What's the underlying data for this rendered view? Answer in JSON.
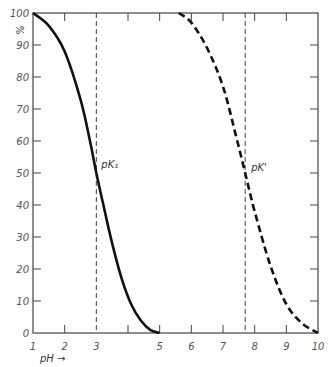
{
  "chart_data": {
    "type": "line",
    "title": "",
    "xlabel": "pH →",
    "ylabel": "%",
    "xlim": [
      1,
      10
    ],
    "ylim": [
      0,
      100
    ],
    "x_ticks": [
      1,
      2,
      3,
      4,
      5,
      6,
      7,
      8,
      9,
      10
    ],
    "x_tick_labels": [
      "1",
      "2",
      "3",
      "",
      "5",
      "6",
      "7",
      "8",
      "9",
      "10"
    ],
    "y_ticks": [
      0,
      10,
      20,
      30,
      40,
      50,
      60,
      70,
      80,
      90,
      100
    ],
    "y_tick_labels": [
      "0",
      "10",
      "20",
      "30",
      "40",
      "50",
      "60",
      "70",
      "80",
      "90",
      "100"
    ],
    "grid": false,
    "legend": null,
    "series": [
      {
        "name": "pK1 curve",
        "style": "solid",
        "x": [
          1.0,
          1.5,
          2.0,
          2.5,
          2.8,
          3.0,
          3.2,
          3.5,
          3.8,
          4.1,
          4.4,
          4.7,
          5.0
        ],
        "values": [
          100,
          96,
          88,
          73,
          60,
          50,
          41,
          28,
          17,
          9,
          4,
          1,
          0
        ]
      },
      {
        "name": "pK' curve",
        "style": "dashed",
        "x": [
          5.6,
          6.0,
          6.5,
          7.0,
          7.4,
          7.7,
          8.0,
          8.5,
          9.0,
          9.5,
          10.0
        ],
        "values": [
          100,
          97,
          89,
          77,
          62,
          50,
          38,
          21,
          9,
          3,
          0
        ]
      }
    ],
    "reference_lines": [
      {
        "orientation": "vertical",
        "x": 3.0,
        "style": "dashed",
        "label": "pK₁"
      },
      {
        "orientation": "vertical",
        "x": 7.7,
        "style": "dashed",
        "label": "pK'"
      }
    ],
    "annotations": [
      {
        "text": "pK₁",
        "x": 3.0,
        "y": 50
      },
      {
        "text": "pK'",
        "x": 7.7,
        "y": 50
      }
    ]
  },
  "labels": {
    "y_axis": "%",
    "x_axis": "pH →",
    "pk1": "pK₁",
    "pk_prime": "pK'"
  },
  "colors": {
    "curve": "#111111",
    "axis": "#444444",
    "background": "#ffffff"
  }
}
